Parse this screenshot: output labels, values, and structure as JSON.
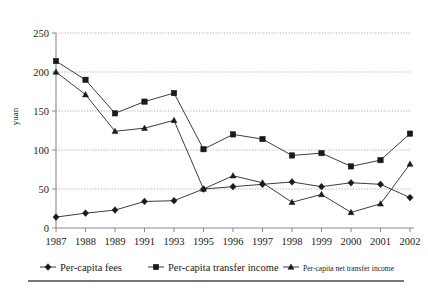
{
  "chart_data": {
    "type": "line",
    "title": "",
    "xlabel": "",
    "ylabel": "yuan",
    "ylim": [
      0,
      250
    ],
    "yticks": [
      0,
      50,
      100,
      150,
      200,
      250
    ],
    "grid": true,
    "legend_position": "bottom",
    "categories": [
      "1987",
      "1988",
      "1989",
      "1991",
      "1993",
      "1995",
      "1996",
      "1997",
      "1998",
      "1999",
      "2000",
      "2001",
      "2002"
    ],
    "series": [
      {
        "name": "Per-capita fees",
        "marker": "diamond",
        "values": [
          14,
          19,
          23,
          34,
          35,
          50,
          53,
          56,
          59,
          53,
          58,
          56,
          39
        ]
      },
      {
        "name": "Per-capita transfer income",
        "marker": "square",
        "values": [
          214,
          190,
          147,
          162,
          173,
          101,
          120,
          114,
          93,
          96,
          79,
          87,
          121
        ]
      },
      {
        "name": "Per-capita net transfer income",
        "marker": "triangle",
        "values": [
          200,
          171,
          124,
          128,
          138,
          50,
          67,
          58,
          33,
          43,
          20,
          31,
          82
        ]
      }
    ]
  },
  "legend": {
    "items": [
      {
        "label": "Per-capita fees",
        "marker": "diamond",
        "size": "normal"
      },
      {
        "label": "Per-capita transfer income",
        "marker": "square",
        "size": "normal"
      },
      {
        "label": "Per-capita net transfer income",
        "marker": "triangle",
        "size": "small"
      }
    ]
  },
  "axis": {
    "y_label": "yuan",
    "y_ticks": [
      "0",
      "50",
      "100",
      "150",
      "200",
      "250"
    ],
    "x_ticks": [
      "1987",
      "1988",
      "1989",
      "1991",
      "1993",
      "1995",
      "1996",
      "1997",
      "1998",
      "1999",
      "2000",
      "2001",
      "2002"
    ]
  },
  "colors": {
    "ink": "#1a1a1a",
    "line": "#3d3d3d",
    "grid": "#9a9a9a",
    "axis": "#8a8a8a",
    "background": "#ffffff"
  }
}
